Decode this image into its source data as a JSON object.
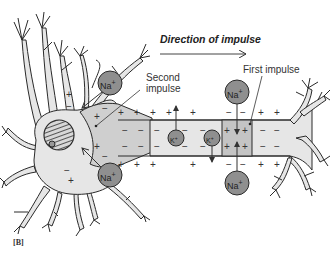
{
  "figure": {
    "panel_label": "[B]",
    "direction_label": "Direction of impulse",
    "labels": {
      "second_impulse_line1": "Second",
      "second_impulse_line2": "impulse",
      "first_impulse": "First impulse"
    },
    "ions": {
      "sodium": "Na",
      "potassium": "K",
      "charge_plus": "+"
    },
    "colors": {
      "cell_fill": "#e6e6e6",
      "active_zone_fill": "#c8c8c8",
      "ion_fill": "#8f8f8f",
      "outline": "#2a2a2a",
      "nucleus_fill": "#9a9a9a"
    }
  }
}
